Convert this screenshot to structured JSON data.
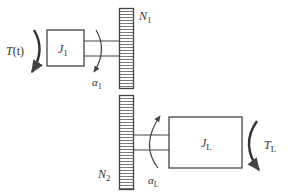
{
  "diagram": {
    "input_torque": {
      "symbol": "T",
      "arg": "(t)"
    },
    "input_inertia": {
      "symbol": "J",
      "subscript": "1"
    },
    "input_accel": {
      "symbol": "α",
      "subscript": "1"
    },
    "gear1": {
      "symbol": "N",
      "subscript": "1"
    },
    "gear2": {
      "symbol": "N",
      "subscript": "2"
    },
    "load_inertia": {
      "symbol": "J",
      "subscript": "L"
    },
    "load_accel": {
      "symbol": "α",
      "subscript": "L"
    },
    "load_torque": {
      "symbol": "T",
      "subscript": "L"
    },
    "colors": {
      "stroke": "#444444",
      "text": "#333333",
      "background": "#ffffff"
    }
  }
}
